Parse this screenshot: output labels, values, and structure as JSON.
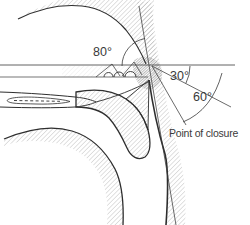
{
  "figure": {
    "angles": {
      "a80": "80°",
      "a30": "30°",
      "a60": "60°"
    },
    "annotations": {
      "point_of_closure": "Point of closure"
    },
    "colors": {
      "line": "#2e2e2e",
      "hatch": "#a9a9a9",
      "text": "#3a3a3a",
      "background": "#ffffff"
    }
  }
}
